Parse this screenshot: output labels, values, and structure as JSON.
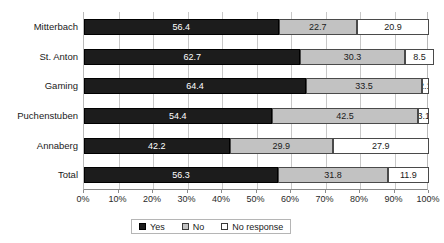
{
  "chart_data": {
    "type": "bar",
    "orientation": "horizontal",
    "stacked": true,
    "stack_total": 100,
    "title": "",
    "xlabel": "",
    "ylabel": "",
    "xlim": [
      0,
      100
    ],
    "grid": true,
    "legend_position": "bottom",
    "categories": [
      "Mitterbach",
      "St. Anton",
      "Gaming",
      "Puchenstuben",
      "Annaberg",
      "Total"
    ],
    "series": [
      {
        "name": "Yes",
        "color": "#1c1c1c",
        "values": [
          56.4,
          62.7,
          64.4,
          54.4,
          42.2,
          56.3
        ]
      },
      {
        "name": "No",
        "color": "#c2c2c2",
        "values": [
          22.7,
          30.3,
          33.5,
          42.5,
          29.9,
          31.8
        ]
      },
      {
        "name": "No response",
        "color": "#ffffff",
        "values": [
          20.9,
          8.5,
          2.1,
          3.1,
          27.9,
          11.9
        ]
      }
    ],
    "xticks": [
      0,
      10,
      20,
      30,
      40,
      50,
      60,
      70,
      80,
      90,
      100
    ],
    "xticklabels": [
      "0%",
      "10%",
      "20%",
      "30%",
      "40%",
      "50%",
      "60%",
      "70%",
      "80%",
      "90%",
      "100%"
    ],
    "data_label_format": "one-decimal"
  },
  "legend": {
    "items": [
      {
        "label": "Yes",
        "swatch": "black-square"
      },
      {
        "label": "No",
        "swatch": "gray-square"
      },
      {
        "label": "No response",
        "swatch": "white-square"
      }
    ]
  }
}
